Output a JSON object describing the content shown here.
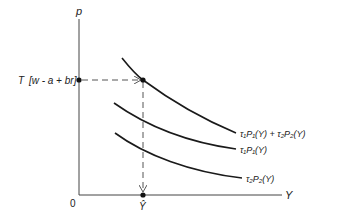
{
  "diagram": {
    "axes": {
      "y_label": "p",
      "x_label": "Y",
      "origin_label": "0"
    },
    "y_marker": {
      "label_prefix": "T",
      "label_bracket": "[w - a + br]"
    },
    "x_marker": {
      "label": "Ŷ"
    },
    "curves": [
      {
        "id": "sum",
        "label_main": "τ",
        "label": "τ₁P₁(Y) + τ₂P₂(Y)"
      },
      {
        "id": "p1",
        "label": "τ₁P₁(Y)"
      },
      {
        "id": "p2",
        "label": "τ₂P₂(Y)"
      }
    ],
    "colors": {
      "line": "#1a1a1a",
      "axis": "#444444",
      "dash": "#555555"
    }
  }
}
